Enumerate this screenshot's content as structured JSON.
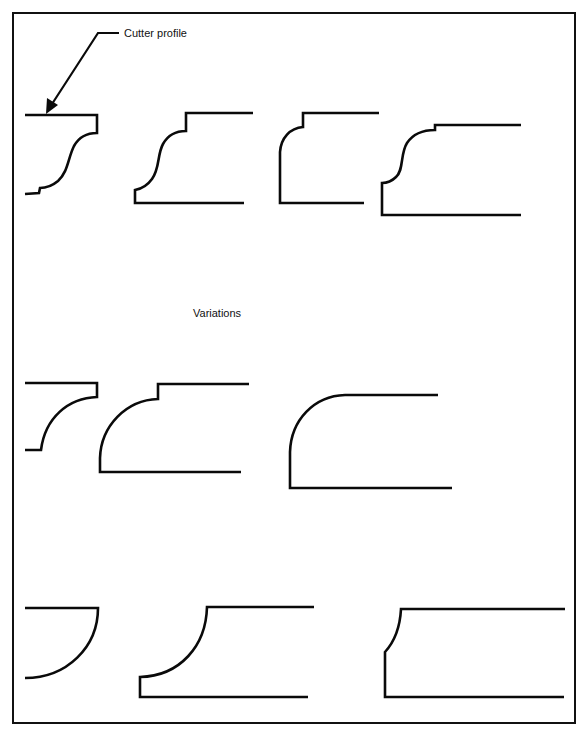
{
  "figure": {
    "callout_label": "Cutter profile",
    "section_heading": "Variations",
    "colors": {
      "line": "#0a0a0a",
      "background": "#ffffff"
    },
    "profiles": [
      {
        "row": 1,
        "index": 1,
        "name": "ogee-with-fillet-cutter-profile"
      },
      {
        "row": 1,
        "index": 2,
        "name": "ogee-with-step-and-fillet"
      },
      {
        "row": 1,
        "index": 3,
        "name": "ovolo-with-step"
      },
      {
        "row": 1,
        "index": 4,
        "name": "wide-ogee-with-step"
      },
      {
        "row": 2,
        "index": 1,
        "name": "cove-cutter-with-fillet"
      },
      {
        "row": 2,
        "index": 2,
        "name": "quarter-round-with-step"
      },
      {
        "row": 2,
        "index": 3,
        "name": "large-quarter-round"
      },
      {
        "row": 3,
        "index": 1,
        "name": "half-cove-cutter"
      },
      {
        "row": 3,
        "index": 2,
        "name": "cove-with-fillet"
      },
      {
        "row": 3,
        "index": 3,
        "name": "small-chamfer-cove"
      }
    ]
  }
}
